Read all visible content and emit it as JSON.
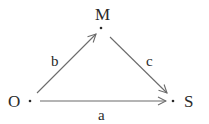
{
  "diagram": {
    "nodes": [
      {
        "id": "M",
        "label": "M",
        "x": 101,
        "y": 28
      },
      {
        "id": "O",
        "label": "O",
        "x": 30,
        "y": 101
      },
      {
        "id": "S",
        "label": "S",
        "x": 173,
        "y": 101
      }
    ],
    "edges": [
      {
        "from": "O",
        "to": "M",
        "label": "b"
      },
      {
        "from": "M",
        "to": "S",
        "label": "c"
      },
      {
        "from": "O",
        "to": "S",
        "label": "a"
      }
    ],
    "colors": {
      "line": "#6b6b6b",
      "text": "#2a2a2a",
      "background": "#ffffff"
    }
  }
}
